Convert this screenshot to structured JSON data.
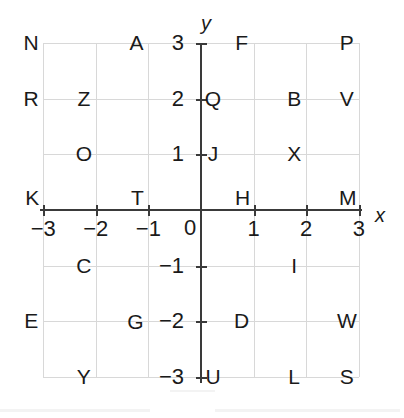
{
  "figure": {
    "kind": "coordinate-plane",
    "axis_labels": {
      "x": "x",
      "y": "y"
    },
    "origin_label": "0",
    "x_tick_labels": [
      "−3",
      "−2",
      "−1",
      "1",
      "2",
      "3"
    ],
    "y_tick_labels": [
      "3",
      "2",
      "1",
      "−1",
      "−2",
      "−3"
    ],
    "x_range": [
      -3,
      3
    ],
    "y_range": [
      -3,
      3
    ],
    "grid": true
  },
  "chart_data": {
    "type": "scatter",
    "title": "",
    "xlabel": "x",
    "ylabel": "y",
    "xlim": [
      -3,
      3
    ],
    "ylim": [
      -3,
      3
    ],
    "xticks": [
      -3,
      -2,
      -1,
      0,
      1,
      2,
      3
    ],
    "yticks": [
      -3,
      -2,
      -1,
      0,
      1,
      2,
      3
    ],
    "grid": true,
    "legend": "none",
    "points": [
      {
        "label": "N",
        "x": -3,
        "y": 3
      },
      {
        "label": "A",
        "x": -1,
        "y": 3
      },
      {
        "label": "F",
        "x": 1,
        "y": 3
      },
      {
        "label": "P",
        "x": 3,
        "y": 3
      },
      {
        "label": "R",
        "x": -3,
        "y": 2
      },
      {
        "label": "Z",
        "x": -2,
        "y": 2
      },
      {
        "label": "Q",
        "x": 0,
        "y": 2
      },
      {
        "label": "B",
        "x": 2,
        "y": 2
      },
      {
        "label": "V",
        "x": 3,
        "y": 2
      },
      {
        "label": "O",
        "x": -2,
        "y": 1
      },
      {
        "label": "J",
        "x": 0,
        "y": 1
      },
      {
        "label": "X",
        "x": 2,
        "y": 1
      },
      {
        "label": "K",
        "x": -3,
        "y": 0
      },
      {
        "label": "T",
        "x": -1,
        "y": 0
      },
      {
        "label": "H",
        "x": 1,
        "y": 0
      },
      {
        "label": "M",
        "x": 3,
        "y": 0
      },
      {
        "label": "C",
        "x": -2,
        "y": -1
      },
      {
        "label": "I",
        "x": 2,
        "y": -1
      },
      {
        "label": "E",
        "x": -3,
        "y": -2
      },
      {
        "label": "G",
        "x": -1,
        "y": -2
      },
      {
        "label": "D",
        "x": 1,
        "y": -2
      },
      {
        "label": "W",
        "x": 3,
        "y": -2
      },
      {
        "label": "Y",
        "x": -2,
        "y": -3
      },
      {
        "label": "U",
        "x": 0,
        "y": -3
      },
      {
        "label": "L",
        "x": 2,
        "y": -3
      },
      {
        "label": "S",
        "x": 3,
        "y": -3
      }
    ]
  },
  "colors": {
    "grid": "#d8d8d8",
    "axis": "#3a3a3a",
    "text": "#1a1a1a",
    "background": "#ffffff"
  }
}
